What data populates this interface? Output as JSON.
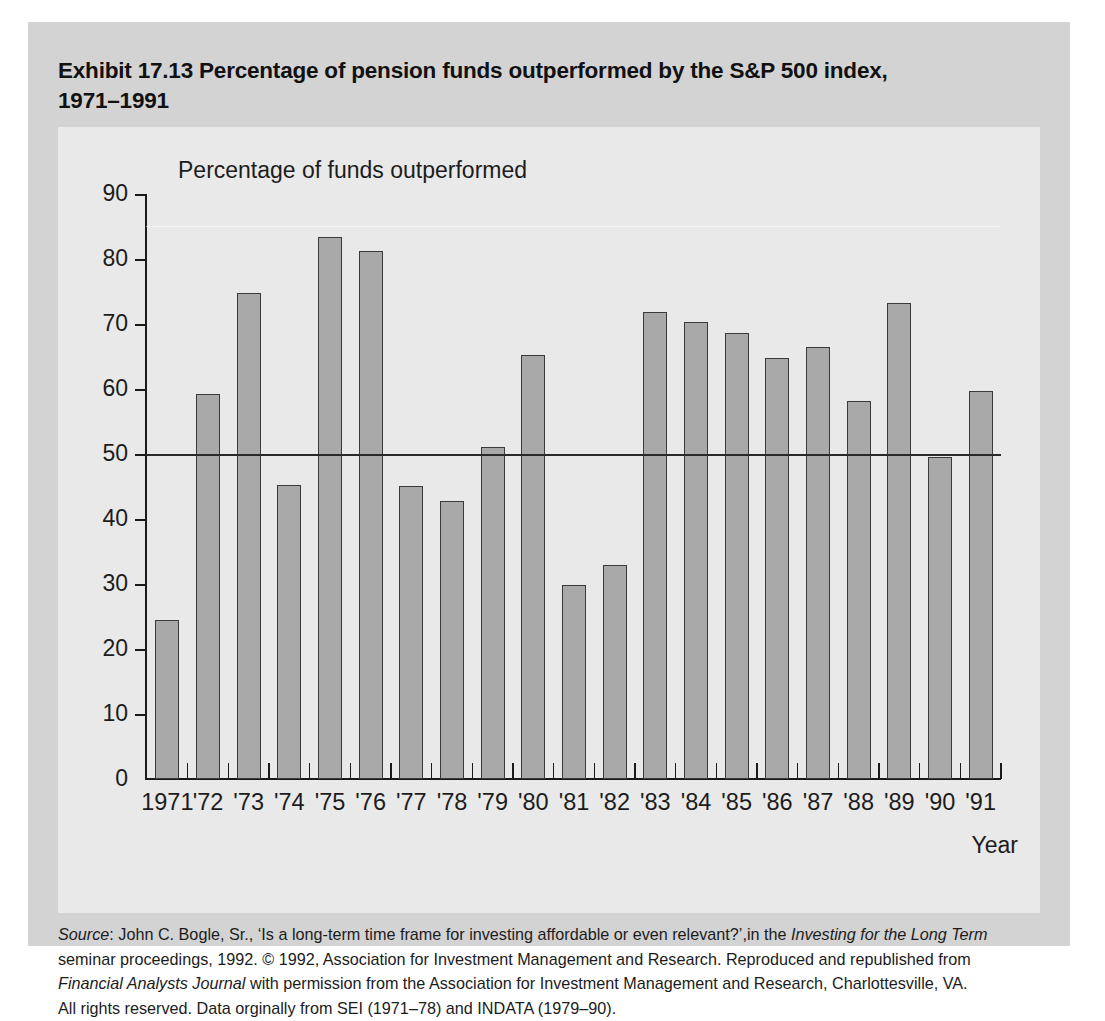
{
  "exhibit": {
    "title_line1": "Exhibit 17.13  Percentage of pension funds outperformed by the S&P 500 index,",
    "title_line2": "1971–1991"
  },
  "chart_data": {
    "type": "bar",
    "title": "Exhibit 17.13  Percentage of pension funds outperformed by the S&P 500 index, 1971–1991",
    "xlabel": "Year",
    "ylabel": "Percentage of funds outperformed",
    "ylim": [
      0,
      90
    ],
    "yticks": [
      0,
      10,
      20,
      30,
      40,
      50,
      60,
      70,
      80,
      90
    ],
    "ytick_labels": [
      "0",
      "10",
      "20",
      "30",
      "40",
      "50",
      "60",
      "70",
      "80",
      "90"
    ],
    "grid": false,
    "legend": null,
    "reference_line": 50,
    "categories": [
      "1971",
      "'72",
      "'73",
      "'74",
      "'75",
      "'76",
      "'77",
      "'78",
      "'79",
      "'80",
      "'81",
      "'82",
      "'83",
      "'84",
      "'85",
      "'86",
      "'87",
      "'88",
      "'89",
      "'90",
      "'91"
    ],
    "years": [
      1971,
      1972,
      1973,
      1974,
      1975,
      1976,
      1977,
      1978,
      1979,
      1980,
      1981,
      1982,
      1983,
      1984,
      1985,
      1986,
      1987,
      1988,
      1989,
      1990,
      1991
    ],
    "values": [
      24.4,
      59.3,
      74.7,
      45.2,
      83.4,
      81.3,
      45.1,
      42.8,
      51.1,
      65.2,
      29.8,
      33.0,
      71.8,
      70.3,
      68.6,
      64.8,
      66.5,
      58.2,
      73.3,
      49.6,
      59.7
    ],
    "bar_color": "#a9a9a9",
    "bar_edge_color": "#3a3a3a"
  },
  "axis_captions": {
    "y": "Percentage of funds outperformed",
    "x": "Year"
  },
  "source": {
    "line1_a": "Source",
    "line1_b": ": John C. Bogle, Sr., ‘Is a long-term time frame for investing affordable or even relevant?’,in the ",
    "line1_c": "Investing for the Long Term",
    "line2": "seminar proceedings, 1992. © 1992, Association for Investment Management and Research. Reproduced and republished from",
    "line3_a": "Financial Analysts Journal",
    "line3_b": " with permission from the Association for Investment Management and Research, Charlottesville, VA.",
    "line4": "All rights reserved. Data orginally from SEI (1971–78) and INDATA (1979–90)."
  },
  "colors": {
    "panel_bg": "#d3d3d3",
    "card_bg": "#e9e9e9",
    "page_bg": "#ffffff",
    "ink": "#1c1c1c"
  }
}
